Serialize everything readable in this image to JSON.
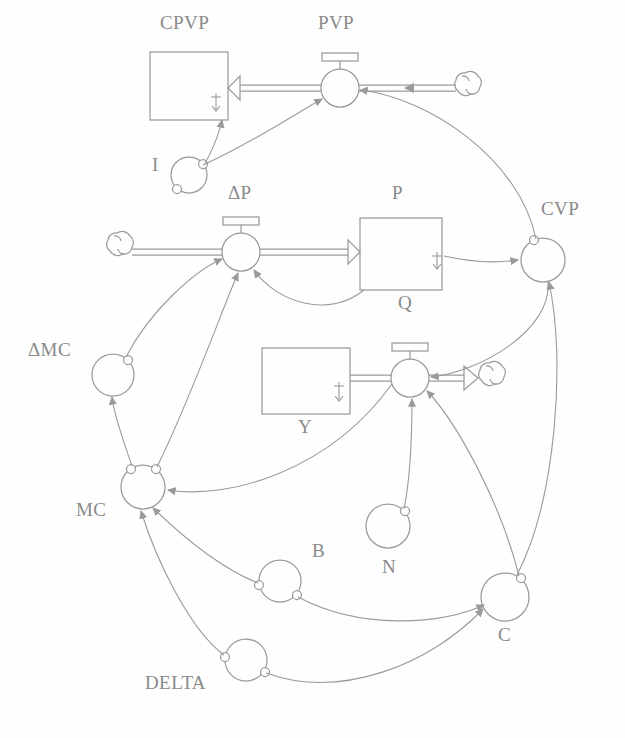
{
  "diagram": {
    "stroke_color": "#9a9a9a",
    "background_color": "#fefefe",
    "width": 625,
    "height": 738,
    "stocks": [
      {
        "id": "CPVP",
        "label": "CPVP",
        "x": 150,
        "y": 52,
        "w": 78,
        "h": 68,
        "label_x": 160,
        "label_y": 20
      },
      {
        "id": "P",
        "label": "P",
        "x": 360,
        "y": 218,
        "w": 82,
        "h": 72,
        "label_x": 392,
        "label_y": 190
      },
      {
        "id": "Y",
        "label": "Y",
        "x": 262,
        "y": 348,
        "w": 88,
        "h": 66,
        "label_x": 298,
        "label_y": 424
      }
    ],
    "flows": [
      {
        "id": "PVP",
        "label": "PVP",
        "cx": 340,
        "cy": 88,
        "r": 19,
        "label_x": 318,
        "label_y": 20
      },
      {
        "id": "DP",
        "label": "ΔP",
        "cx": 241,
        "cy": 252,
        "r": 19,
        "label_x": 228,
        "label_y": 188
      },
      {
        "id": "Q",
        "label": "Q",
        "cx": 410,
        "cy": 378,
        "r": 19,
        "label_x": 398,
        "label_y": 298
      }
    ],
    "auxiliaries": [
      {
        "id": "I",
        "label": "I",
        "cx": 189,
        "cy": 175,
        "r": 18,
        "label_x": 152,
        "label_y": 160
      },
      {
        "id": "CVP",
        "label": "CVP",
        "cx": 543,
        "cy": 260,
        "r": 22,
        "label_x": 541,
        "label_y": 204
      },
      {
        "id": "DMC",
        "label": "ΔMC",
        "cx": 113,
        "cy": 375,
        "r": 21,
        "label_x": 30,
        "label_y": 345
      },
      {
        "id": "MC",
        "label": "MC",
        "cx": 143,
        "cy": 487,
        "r": 22,
        "label_x": 78,
        "label_y": 505
      },
      {
        "id": "B",
        "label": "B",
        "cx": 280,
        "cy": 581,
        "r": 21,
        "label_x": 312,
        "label_y": 546
      },
      {
        "id": "N",
        "label": "N",
        "cx": 388,
        "cy": 526,
        "r": 22,
        "label_x": 382,
        "label_y": 562
      },
      {
        "id": "C",
        "label": "C",
        "cx": 505,
        "cy": 597,
        "r": 24,
        "label_x": 498,
        "label_y": 630
      },
      {
        "id": "DELTA",
        "label": "DELTA",
        "cx": 246,
        "cy": 660,
        "r": 21,
        "label_x": 147,
        "label_y": 678
      }
    ],
    "clouds": [
      {
        "id": "cloud-pvp-source",
        "cx": 468,
        "cy": 88
      },
      {
        "id": "cloud-dp-source",
        "cx": 120,
        "cy": 248
      },
      {
        "id": "cloud-q-sink",
        "cx": 492,
        "cy": 378
      }
    ],
    "pipes": [
      {
        "id": "pipe-pvp-to-cpvp",
        "from": "PVP",
        "to": "CPVP"
      },
      {
        "id": "pipe-cloud-to-pvp",
        "from": "cloud-pvp-source",
        "to": "PVP"
      },
      {
        "id": "pipe-cloud-to-dp",
        "from": "cloud-dp-source",
        "to": "DP"
      },
      {
        "id": "pipe-dp-to-p",
        "from": "DP",
        "to": "P"
      },
      {
        "id": "pipe-y-to-q",
        "from": "Y",
        "to": "Q"
      },
      {
        "id": "pipe-q-to-cloud",
        "from": "Q",
        "to": "cloud-q-sink"
      }
    ],
    "links": [
      {
        "id": "link-I-to-PVP",
        "from": "I",
        "to": "PVP"
      },
      {
        "id": "link-CPVP-to-I",
        "from": "CPVP",
        "to": "I"
      },
      {
        "id": "link-P-to-CVP",
        "from": "P",
        "to": "CVP"
      },
      {
        "id": "link-P-to-DP",
        "from": "P",
        "to": "DP"
      },
      {
        "id": "link-CVP-to-PVP",
        "from": "CVP",
        "to": "PVP"
      },
      {
        "id": "link-CVP-to-Q",
        "from": "CVP",
        "to": "Q"
      },
      {
        "id": "link-C-to-CVP",
        "from": "C",
        "to": "CVP"
      },
      {
        "id": "link-DMC-to-DP",
        "from": "DMC",
        "to": "DP"
      },
      {
        "id": "link-MC-to-DMC",
        "from": "MC",
        "to": "DMC"
      },
      {
        "id": "link-MC-to-DP",
        "from": "MC",
        "to": "DP"
      },
      {
        "id": "link-Q-to-MC",
        "from": "Q",
        "to": "MC"
      },
      {
        "id": "link-B-to-MC",
        "from": "B",
        "to": "MC"
      },
      {
        "id": "link-DELTA-to-MC",
        "from": "DELTA",
        "to": "MC"
      },
      {
        "id": "link-B-to-C",
        "from": "B",
        "to": "C"
      },
      {
        "id": "link-DELTA-to-C",
        "from": "DELTA",
        "to": "C"
      },
      {
        "id": "link-N-to-Q",
        "from": "N",
        "to": "Q"
      },
      {
        "id": "link-C-to-Q",
        "from": "C",
        "to": "Q"
      }
    ]
  }
}
